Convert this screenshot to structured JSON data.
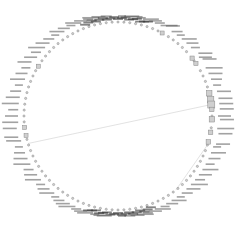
{
  "diagram": {
    "type": "circular-network-graph",
    "center": [
      118,
      116
    ],
    "radius": 94,
    "node_count": 100,
    "node_color": "#cfcfcf",
    "node_stroke": "#888888",
    "edge_color": "#d6d6d6",
    "label_color": "#333333",
    "highlighted_square_nodes": [
      {
        "angle_deg": -38,
        "size": 4.2
      },
      {
        "angle_deg": -34,
        "size": 4.2
      },
      {
        "angle_deg": -14,
        "size": 5.5
      },
      {
        "angle_deg": -10,
        "size": 6.5
      },
      {
        "angle_deg": -7,
        "size": 7.0
      },
      {
        "angle_deg": -4,
        "size": 4.5
      },
      {
        "angle_deg": 2,
        "size": 5.5
      },
      {
        "angle_deg": 10,
        "size": 4.5
      },
      {
        "angle_deg": 16,
        "size": 4.5
      },
      {
        "angle_deg": -148,
        "size": 4.0
      },
      {
        "angle_deg": 168,
        "size": 4.0
      },
      {
        "angle_deg": 173,
        "size": 4.0
      },
      {
        "angle_deg": -62,
        "size": 4.0
      }
    ],
    "edges": [
      {
        "from_angle_deg": 163,
        "to_angle_deg": -7
      },
      {
        "from_angle_deg": 18,
        "to_angle_deg": 52
      }
    ],
    "labels_note": "Node labels are rendered around the ring but are illegible at this resolution."
  }
}
